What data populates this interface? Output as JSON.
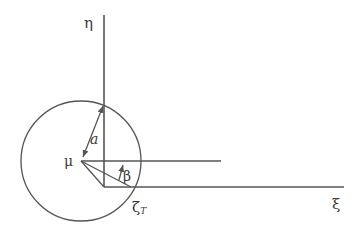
{
  "diagram": {
    "colors": {
      "stroke": "#555555",
      "text": "#3a3a3a",
      "background": "#ffffff"
    },
    "axes": {
      "vertical_label": "η",
      "horizontal_label": "ξ"
    },
    "labels": {
      "center": "μ",
      "radius": "a",
      "angle": "β",
      "point_base": "ζ",
      "point_sub": "T"
    }
  }
}
